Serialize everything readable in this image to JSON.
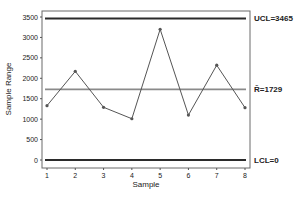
{
  "chart_data": {
    "type": "line",
    "title": "",
    "xlabel": "Sample",
    "ylabel": "Sample Range",
    "x": [
      1,
      2,
      3,
      4,
      5,
      6,
      7,
      8
    ],
    "categories": [
      "1",
      "2",
      "3",
      "4",
      "5",
      "6",
      "7",
      "8"
    ],
    "series": [
      {
        "name": "Sample Range",
        "values": [
          1330,
          2170,
          1290,
          1010,
          3200,
          1100,
          2320,
          1280
        ]
      }
    ],
    "control_limits": {
      "UCL": 3465,
      "center_R_bar": 1729,
      "LCL": 0
    },
    "annotations": [
      "UCL=3465",
      "R̄=1729",
      "LCL=0"
    ],
    "yticks": [
      0,
      500,
      1000,
      1500,
      2000,
      2500,
      3000,
      3500
    ],
    "xticks": [
      1,
      2,
      3,
      4,
      5,
      6,
      7,
      8
    ],
    "ylim": [
      -250,
      3800
    ],
    "xlim": [
      0.8,
      8.2
    ],
    "grid": false,
    "legend": "none"
  },
  "labels": {
    "ucl": "UCL=3465",
    "center": "R̄=1729",
    "lcl": "LCL=0",
    "xlabel": "Sample",
    "ylabel": "Sample Range"
  },
  "colors": {
    "limit_line": "#2b2b2b",
    "center_line": "#8a8a8a",
    "data_line": "#555555",
    "frame": "#555555"
  }
}
